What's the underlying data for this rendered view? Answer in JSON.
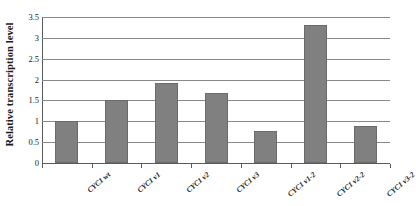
{
  "chart_data": {
    "type": "bar",
    "title": "",
    "xlabel": "",
    "ylabel": "Relative transcription level",
    "categories": [
      "CYC1 wt",
      "CYC1 v1",
      "CYC1 v2",
      "CYC1 v3",
      "CYC1 v1-2",
      "CYC1 v2-2",
      "CYC1 v3-2"
    ],
    "values": [
      1.0,
      1.51,
      1.93,
      1.67,
      0.76,
      3.3,
      0.88
    ],
    "ylim": [
      0,
      3.5
    ],
    "yticks": [
      "0",
      "0.5",
      "1",
      "1.5",
      "2",
      "2.5",
      "3",
      "3.5"
    ],
    "ytick_values": [
      0,
      0.5,
      1,
      1.5,
      2,
      2.5,
      3,
      3.5
    ],
    "grid": true,
    "legend": false,
    "bar_color": "#808080",
    "bar_edge_color": "#6b6b6b",
    "gridline_color": "#898989",
    "axis_color": "#5a5a5a"
  }
}
